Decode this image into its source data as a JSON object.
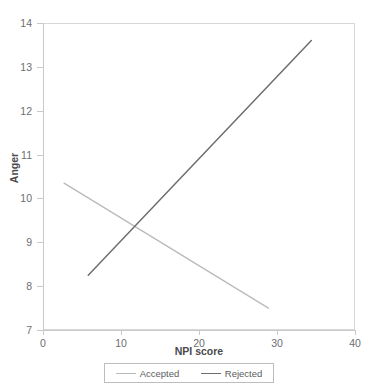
{
  "chart_data": {
    "type": "line",
    "title": "",
    "xlabel": "NPI score",
    "ylabel": "Anger",
    "xlim": [
      0,
      40
    ],
    "ylim": [
      7,
      14
    ],
    "xticks": [
      0,
      10,
      20,
      30,
      40
    ],
    "yticks": [
      7,
      8,
      9,
      10,
      11,
      12,
      13,
      14
    ],
    "xtick_labels": [
      "0",
      "10",
      "20",
      "30",
      "40"
    ],
    "ytick_labels": [
      "7",
      "8",
      "9",
      "10",
      "11",
      "12",
      "13",
      "14"
    ],
    "grid": false,
    "legend_position": "bottom",
    "series": [
      {
        "name": "Accepted",
        "color": "#b9babc",
        "x": [
          2.7,
          28.9
        ],
        "y": [
          10.35,
          7.5
        ],
        "points": [
          {
            "x": 2.7,
            "y": 10.35
          },
          {
            "x": 28.9,
            "y": 7.5
          }
        ]
      },
      {
        "name": "Rejected",
        "color": "#6d6e71",
        "x": [
          5.8,
          34.4
        ],
        "y": [
          8.25,
          13.6
        ],
        "points": [
          {
            "x": 5.8,
            "y": 8.25
          },
          {
            "x": 34.4,
            "y": 13.6
          }
        ]
      }
    ],
    "annotations": [
      {
        "label": "intersection",
        "x": 11.9,
        "y": 9.4
      }
    ]
  },
  "legend": {
    "items": [
      {
        "label": "Accepted",
        "color": "#b9babc"
      },
      {
        "label": "Rejected",
        "color": "#6d6e71"
      }
    ]
  },
  "colors": {
    "accepted": "#b9babc",
    "rejected": "#6d6e71",
    "axis": "#c9c9c9",
    "frame": "#d8d8d8",
    "text": "#6d6e71",
    "background": "#ffffff"
  }
}
